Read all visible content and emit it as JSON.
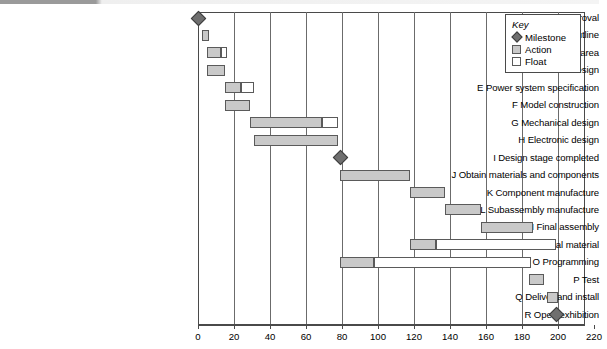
{
  "chart_data": {
    "type": "bar",
    "subtype": "gantt",
    "title": "",
    "xlabel": "",
    "ylabel": "",
    "xlim": [
      0,
      220
    ],
    "xticks": [
      0,
      20,
      40,
      60,
      80,
      100,
      120,
      140,
      160,
      180,
      200,
      220
    ],
    "grid": true,
    "grid_axis": "x",
    "legend": {
      "title": "Key",
      "position": "top-right",
      "entries": [
        {
          "label": "Milestone",
          "swatch": "milestone-diamond",
          "color": "#6f6f6f"
        },
        {
          "label": "Action",
          "swatch": "action-box",
          "color": "#c9c9c9"
        },
        {
          "label": "Float",
          "swatch": "float-box",
          "color": "#ffffff"
        }
      ]
    },
    "categories": [
      "A Receive approval",
      "B Agree project outline",
      "C Equip working area",
      "D Schematic design",
      "E Power system specification",
      "F Model construction",
      "G Mechanical design",
      "H Electronic design",
      "I Design stage completed",
      "J Obtain materials and components",
      "K Component manufacture",
      "L Subassembly manufacture",
      "M Final assembly",
      "N Produce promotional material",
      "O Programming",
      "P Test",
      "Q Deliver and install",
      "R Open exhibition"
    ],
    "tasks": [
      {
        "id": "A",
        "label": "A Receive approval",
        "kind": "milestone",
        "at": 0
      },
      {
        "id": "B",
        "label": "B Agree project outline",
        "kind": "bar",
        "action_start": 2,
        "action_end": 6,
        "float_end": 6
      },
      {
        "id": "C",
        "label": "C Equip working area",
        "kind": "bar",
        "action_start": 5,
        "action_end": 13,
        "float_end": 16
      },
      {
        "id": "D",
        "label": "D Schematic design",
        "kind": "bar",
        "action_start": 5,
        "action_end": 15,
        "float_end": 15
      },
      {
        "id": "E",
        "label": "E Power system specification",
        "kind": "bar",
        "action_start": 15,
        "action_end": 24,
        "float_end": 31
      },
      {
        "id": "F",
        "label": "F Model construction",
        "kind": "bar",
        "action_start": 15,
        "action_end": 29,
        "float_end": 29
      },
      {
        "id": "G",
        "label": "G Mechanical design",
        "kind": "bar",
        "action_start": 29,
        "action_end": 69,
        "float_end": 78
      },
      {
        "id": "H",
        "label": "H Electronic design",
        "kind": "bar",
        "action_start": 31,
        "action_end": 78,
        "float_end": 78
      },
      {
        "id": "I",
        "label": "I Design stage completed",
        "kind": "milestone",
        "at": 79
      },
      {
        "id": "J",
        "label": "J Obtain materials and components",
        "kind": "bar",
        "action_start": 79,
        "action_end": 118,
        "float_end": 118
      },
      {
        "id": "K",
        "label": "K Component manufacture",
        "kind": "bar",
        "action_start": 118,
        "action_end": 137,
        "float_end": 137
      },
      {
        "id": "L",
        "label": "L Subassembly manufacture",
        "kind": "bar",
        "action_start": 137,
        "action_end": 157,
        "float_end": 157
      },
      {
        "id": "M",
        "label": "M Final assembly",
        "kind": "bar",
        "action_start": 157,
        "action_end": 186,
        "float_end": 186
      },
      {
        "id": "N",
        "label": "N Produce promotional material",
        "kind": "bar",
        "action_start": 118,
        "action_end": 132,
        "float_end": 199
      },
      {
        "id": "O",
        "label": "O Programming",
        "kind": "bar",
        "action_start": 79,
        "action_end": 98,
        "float_end": 185
      },
      {
        "id": "P",
        "label": "P Test",
        "kind": "bar",
        "action_start": 184,
        "action_end": 192,
        "float_end": 192
      },
      {
        "id": "Q",
        "label": "Q Deliver and install",
        "kind": "bar",
        "action_start": 194,
        "action_end": 200,
        "float_end": 200
      },
      {
        "id": "R",
        "label": "R Open exhibition",
        "kind": "milestone",
        "at": 199
      }
    ]
  },
  "colors": {
    "action": "#c9c9c9",
    "float": "#ffffff",
    "milestone": "#6f6f6f",
    "stroke": "#5a5a5a",
    "axis": "#4a4a4a",
    "grid": "#6b6b6b"
  }
}
